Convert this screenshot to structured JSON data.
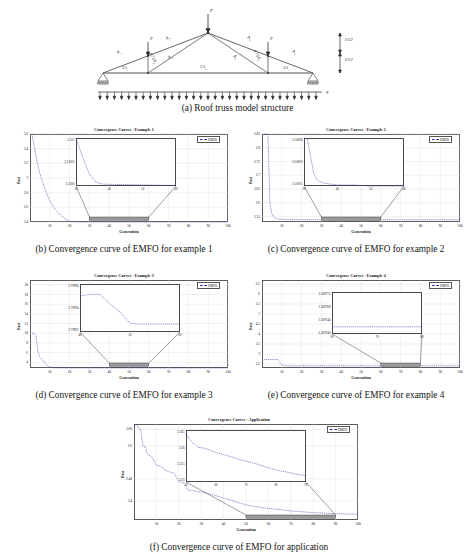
{
  "figure": {
    "panels": [
      {
        "id": "a",
        "caption": "(a) Roof truss model structure"
      },
      {
        "id": "b",
        "caption": "(b) Convergence curve of EMFO for example 1"
      },
      {
        "id": "c",
        "caption": "(c) Convergence curve of EMFO for example 2"
      },
      {
        "id": "d",
        "caption": "(d) Convergence curve of EMFO for example 3"
      },
      {
        "id": "e",
        "caption": "(e) Convergence curve of EMFO for example 4"
      },
      {
        "id": "f",
        "caption": "(f) Convergence curve of EMFO for application"
      }
    ]
  },
  "truss": {
    "load_top_label": "P",
    "load_left_label": "P",
    "load_right_label": "P",
    "distributed_load_label": "q",
    "height_label_upper": "l/12",
    "height_label_lower": "l/12",
    "members": [
      {
        "name": "left-outer-top",
        "label": "A",
        "sub": "1"
      },
      {
        "name": "left-inner-top",
        "label": "A",
        "sub": "2"
      },
      {
        "name": "right-inner-top",
        "label": "A",
        "sub": "2"
      },
      {
        "name": "right-outer-top",
        "label": "A",
        "sub": "1"
      },
      {
        "name": "left-outer-bottom",
        "label": "3A",
        "sub": "1"
      },
      {
        "name": "mid-bottom",
        "label": "2A",
        "sub": "2"
      },
      {
        "name": "right-outer-bottom",
        "label": "3A",
        "sub": "1"
      },
      {
        "name": "left-vertical",
        "label": "0.75A",
        "sub": "1"
      },
      {
        "name": "right-vertical",
        "label": "0.75A",
        "sub": "1"
      },
      {
        "name": "left-diagonal",
        "label": "A",
        "sub": "2"
      },
      {
        "name": "right-diagonal",
        "label": "A",
        "sub": "2"
      }
    ]
  },
  "chart_data": [
    {
      "id": "b",
      "type": "line",
      "title": "Convergence Curves - Example 1",
      "xlabel": "Generation",
      "ylabel": "Best",
      "legend": [
        "EMFO"
      ],
      "legend_position": "top-right",
      "grid": true,
      "xlim": [
        0,
        100
      ],
      "ylim": [
        2.4,
        3.6
      ],
      "xticks": [
        10,
        20,
        30,
        40,
        50,
        60,
        70,
        80,
        90,
        100
      ],
      "yticks": [
        "2.4",
        "2.6",
        "2.8",
        "3",
        "3.2",
        "3.4",
        "3.6"
      ],
      "x": [
        1,
        2,
        3,
        4,
        5,
        6,
        7,
        8,
        9,
        10,
        12,
        14,
        16,
        18,
        20,
        25,
        30,
        40,
        50,
        60,
        70,
        80,
        90,
        100
      ],
      "y": [
        3.62,
        3.45,
        3.3,
        3.17,
        3.06,
        2.97,
        2.89,
        2.82,
        2.75,
        2.69,
        2.6,
        2.53,
        2.48,
        2.44,
        2.41,
        2.36,
        2.34,
        2.332,
        2.3305,
        2.33,
        2.33,
        2.33,
        2.33,
        2.33
      ],
      "inset": {
        "xlim": [
          30,
          60
        ],
        "ylim": [
          2.33,
          2.331
        ],
        "xticks": [
          30,
          40,
          50,
          60
        ],
        "yticks": [
          "2.331",
          "2.33001",
          "2.3300"
        ],
        "x": [
          30,
          32,
          34,
          36,
          38,
          40,
          44,
          48,
          52,
          56,
          60
        ],
        "y": [
          2.331,
          2.3306,
          2.33025,
          2.33008,
          2.33004,
          2.330035,
          2.33003,
          2.330025,
          2.33002,
          2.330015,
          2.33001
        ]
      }
    },
    {
      "id": "c",
      "type": "line",
      "title": "Convergence Curves - Example 2",
      "xlabel": "Generation",
      "ylabel": "Best",
      "legend": [
        "EMFO"
      ],
      "legend_position": "top-right",
      "grid": true,
      "xlim": [
        0,
        100
      ],
      "ylim": [
        2.53,
        2.85
      ],
      "xticks": [
        10,
        20,
        30,
        40,
        50,
        60,
        70,
        80,
        90,
        100
      ],
      "yticks": [
        "2.55",
        "2.6",
        "2.65",
        "2.7",
        "2.75",
        "2.8",
        "2.85"
      ],
      "x": [
        1,
        2,
        3,
        4,
        5,
        6,
        7,
        8,
        10,
        12,
        15,
        20,
        30,
        40,
        50,
        60,
        70,
        80,
        90,
        100
      ],
      "y": [
        2.85,
        2.85,
        2.85,
        2.6,
        2.56,
        2.548,
        2.543,
        2.541,
        2.54,
        2.5395,
        2.539,
        2.5388,
        2.5386,
        2.5385,
        2.5385,
        2.5384,
        2.5384,
        2.5384,
        2.5384,
        2.5384
      ],
      "inset": {
        "xlim": [
          30,
          60
        ],
        "ylim": [
          2.50001,
          2.50006
        ],
        "xticks": [
          30,
          40,
          50,
          60
        ],
        "yticks": [
          "2.50006",
          "2.50003",
          "2.50001"
        ],
        "x": [
          30,
          31,
          32,
          33,
          34,
          36,
          38,
          40,
          45,
          50,
          55,
          60
        ],
        "y": [
          2.50006,
          2.500059,
          2.50004,
          2.500022,
          2.500016,
          2.500013,
          2.500012,
          2.500011,
          2.500011,
          2.50001,
          2.50001,
          2.50001
        ]
      }
    },
    {
      "id": "d",
      "type": "line",
      "title": "Convergence Curves - Example 3",
      "xlabel": "Generation",
      "ylabel": "Best",
      "legend": [
        "EMFO"
      ],
      "legend_position": "top-right",
      "grid": true,
      "xlim": [
        0,
        100
      ],
      "ylim": [
        2.8,
        21
      ],
      "xticks": [
        10,
        20,
        30,
        40,
        50,
        60,
        70,
        80,
        90,
        100
      ],
      "yticks": [
        "4",
        "6",
        "8",
        "10",
        "12",
        "14",
        "16",
        "18",
        "20"
      ],
      "x": [
        1,
        2,
        3,
        4,
        5,
        6,
        7,
        8,
        9,
        10,
        12,
        15,
        20,
        30,
        40,
        50,
        60,
        70,
        80,
        90,
        100
      ],
      "y": [
        10.0,
        10.0,
        9.6,
        6.2,
        5.0,
        4.6,
        4.1,
        3.6,
        3.2,
        2.95,
        2.85,
        2.82,
        2.8,
        2.8,
        2.8,
        2.8,
        2.8,
        2.8,
        2.8,
        2.8,
        2.8
      ],
      "inset": {
        "xlim": [
          40,
          60
        ],
        "ylim": [
          2.79991,
          2.79997
        ],
        "xticks": [
          40,
          50,
          60
        ],
        "yticks": [
          "2.79996",
          "2.79994",
          "2.79992"
        ],
        "x": [
          40,
          42,
          44,
          46,
          48,
          50,
          52,
          54,
          56,
          58,
          60
        ],
        "y": [
          2.799955,
          2.799957,
          2.799957,
          2.799945,
          2.799935,
          2.799921,
          2.79992,
          2.79992,
          2.79992,
          2.79992,
          2.79992
        ]
      }
    },
    {
      "id": "e",
      "type": "line",
      "title": "Convergence Curves - Example 4",
      "xlabel": "Generation",
      "ylabel": "Best",
      "legend": [
        "EMFO"
      ],
      "legend_position": "top-right",
      "grid": true,
      "xlim": [
        0,
        100
      ],
      "ylim": [
        2.3,
        6.7
      ],
      "xticks": [
        10,
        20,
        30,
        40,
        50,
        60,
        70,
        80,
        90,
        100
      ],
      "yticks": [
        "2.5",
        "3",
        "3.5",
        "4",
        "4.5",
        "5",
        "5.5",
        "6",
        "6.5"
      ],
      "x": [
        1,
        2,
        4,
        6,
        8,
        9,
        10,
        12,
        15,
        20,
        30,
        40,
        50,
        60,
        70,
        80,
        90,
        100
      ],
      "y": [
        2.72,
        2.72,
        2.72,
        2.72,
        2.72,
        2.6,
        2.45,
        2.42,
        2.41,
        2.41,
        2.41,
        2.41,
        2.41,
        2.41,
        2.41,
        2.41,
        2.41,
        2.41
      ],
      "inset": {
        "xlim": [
          60,
          80
        ],
        "ylim": [
          2.26974,
          2.269775
        ],
        "xticks": [
          60,
          70,
          80
        ],
        "yticks": [
          "2.269775",
          "2.269768",
          "2.269746",
          "2.269740"
        ],
        "x": [
          60,
          65,
          70,
          75,
          80
        ],
        "y": [
          2.269746,
          2.269746,
          2.269746,
          2.269746,
          2.269746
        ]
      }
    },
    {
      "id": "f",
      "type": "line",
      "title": "Convergence Curves - Application",
      "xlabel": "Generation",
      "ylabel": "Best",
      "legend": [
        "EMFO"
      ],
      "legend_position": "top-right",
      "grid": true,
      "xlim": [
        0,
        100
      ],
      "ylim": [
        2.33,
        2.68
      ],
      "xticks": [
        10,
        20,
        30,
        40,
        50,
        60,
        70,
        80,
        90,
        100
      ],
      "yticks": [
        "2.4",
        "2.48",
        "2.6",
        "2.66"
      ],
      "x": [
        1,
        2,
        3,
        4,
        5,
        6,
        8,
        10,
        12,
        14,
        16,
        18,
        20,
        22,
        24,
        26,
        30,
        34,
        38,
        42,
        46,
        50,
        55,
        60,
        65,
        70,
        75,
        80,
        85,
        90,
        95,
        100
      ],
      "y": [
        2.68,
        2.665,
        2.66,
        2.6,
        2.598,
        2.57,
        2.56,
        2.53,
        2.525,
        2.512,
        2.505,
        2.5,
        2.47,
        2.466,
        2.44,
        2.437,
        2.432,
        2.425,
        2.415,
        2.405,
        2.395,
        2.385,
        2.378,
        2.372,
        2.368,
        2.363,
        2.36,
        2.357,
        2.355,
        2.353,
        2.352,
        2.351
      ],
      "inset": {
        "xlim": [
          50,
          90
        ],
        "ylim": [
          2.35,
          2.365
        ],
        "xticks": [
          50,
          60,
          70,
          80,
          90
        ],
        "yticks": [
          "2.365",
          "2.36",
          "2.355",
          "2.35"
        ],
        "x": [
          50,
          52,
          54,
          56,
          58,
          60,
          63,
          66,
          69,
          72,
          75,
          78,
          81,
          84,
          87,
          90
        ],
        "y": [
          2.3638,
          2.3615,
          2.36,
          2.3598,
          2.3592,
          2.3585,
          2.3578,
          2.357,
          2.3562,
          2.3556,
          2.3548,
          2.354,
          2.3533,
          2.3528,
          2.3522,
          2.3518
        ]
      }
    }
  ]
}
